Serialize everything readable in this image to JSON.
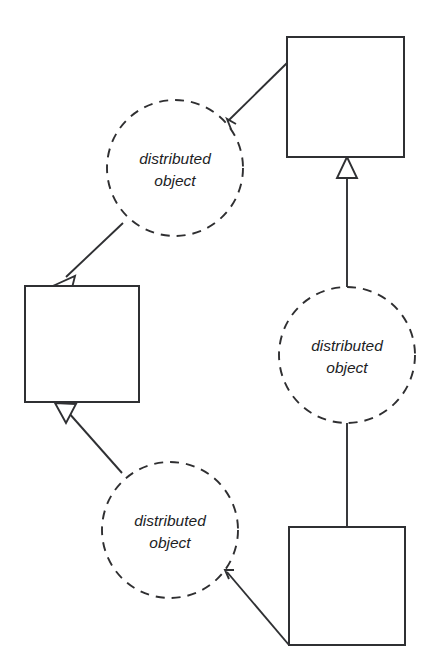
{
  "diagram": {
    "background_color": "#ffffff",
    "stroke_color": "#2f3033",
    "text_color": "#1d1d1f",
    "width": 430,
    "height": 668,
    "boxes": [
      {
        "id": "box-top-right",
        "label": "",
        "x": 287,
        "y": 37,
        "width": 117,
        "height": 120
      },
      {
        "id": "box-left",
        "label": "",
        "x": 25,
        "y": 286,
        "width": 114,
        "height": 116
      },
      {
        "id": "box-bottom-right",
        "label": "",
        "x": 289,
        "y": 527,
        "width": 116,
        "height": 118
      }
    ],
    "circles": [
      {
        "id": "circle-upper-left",
        "line1": "distributed",
        "line2": "object",
        "cx": 175,
        "cy": 168,
        "r": 68
      },
      {
        "id": "circle-middle-right",
        "line1": "distributed",
        "line2": "object",
        "cx": 347,
        "cy": 355,
        "r": 68
      },
      {
        "id": "circle-lower-left",
        "line1": "distributed",
        "line2": "object",
        "cx": 170,
        "cy": 530,
        "r": 68
      }
    ],
    "connectors": [
      {
        "id": "connector-topright-to-circle1",
        "from": "box-top-right",
        "to": "circle-upper-left",
        "arrowhead": "none"
      },
      {
        "id": "connector-circle1-to-boxleft",
        "from": "circle-upper-left",
        "to": "box-left",
        "arrowhead": "hollow-triangle"
      },
      {
        "id": "connector-circle2-to-boxtopright",
        "from": "circle-middle-right",
        "to": "box-top-right",
        "arrowhead": "hollow-triangle"
      },
      {
        "id": "connector-boxbottomright-to-circle2",
        "from": "box-bottom-right",
        "to": "circle-middle-right",
        "arrowhead": "none"
      },
      {
        "id": "connector-boxbottomright-to-circle3",
        "from": "box-bottom-right",
        "to": "circle-lower-left",
        "arrowhead": "none"
      },
      {
        "id": "connector-circle3-to-boxleft",
        "from": "circle-lower-left",
        "to": "box-left",
        "arrowhead": "hollow-triangle"
      }
    ]
  }
}
